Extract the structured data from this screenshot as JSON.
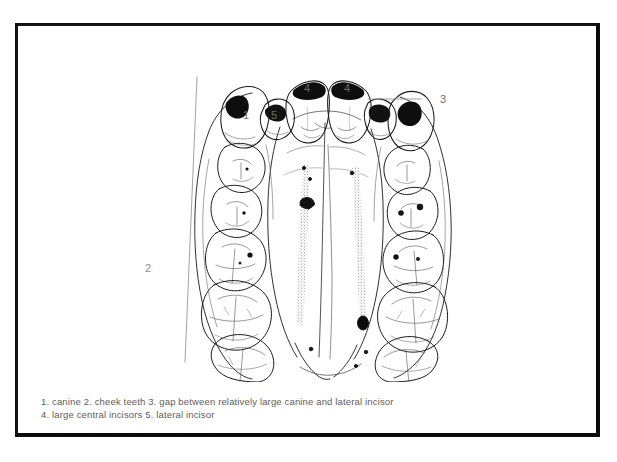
{
  "figure": {
    "title_visible": false,
    "callouts": [
      {
        "id": "c1",
        "label": "1",
        "x": 224,
        "y": 82,
        "style": "dark"
      },
      {
        "id": "c2",
        "label": "2",
        "x": 126,
        "y": 235,
        "style": "light"
      },
      {
        "id": "c3",
        "label": "3",
        "x": 421,
        "y": 88,
        "style": "dark"
      },
      {
        "id": "c4a",
        "label": "4",
        "x": 285,
        "y": 60,
        "style": "dark"
      },
      {
        "id": "c4b",
        "label": "4",
        "x": 325,
        "y": 60,
        "style": "dark"
      },
      {
        "id": "c5",
        "label": "5",
        "x": 252,
        "y": 85,
        "style": "dark"
      }
    ],
    "leader_lines": [
      {
        "id": "leader-2",
        "from_x": 178,
        "from_y": 50,
        "to_x": 166,
        "to_y": 335
      },
      {
        "id": "leader-3",
        "from_x": 349,
        "from_y": 72,
        "to_x": 402,
        "to_y": 72
      }
    ]
  },
  "caption": {
    "line1": "1. canine 2. cheek teeth 3. gap between relatively large canine and lateral incisor",
    "line2": "4. large central incisors 5. lateral incisor"
  },
  "colors": {
    "page_background": "#ffffff",
    "frame_border": "#0a0a0a",
    "ink": "#1a1a1a",
    "caption_text": "#5d5d5d",
    "callout_text": "#8e8e8e"
  }
}
